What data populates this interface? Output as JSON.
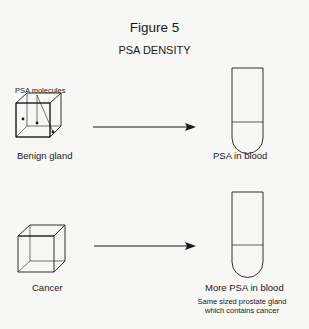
{
  "figure": {
    "title": "Figure 5",
    "subtitle": "PSA DENSITY"
  },
  "benign_row": {
    "callout_label": "PSA molecules",
    "gland_label": "Benign gland",
    "blood_label": "PSA in blood",
    "gland_dot_count": 4,
    "tube_dot_count": 3
  },
  "cancer_row": {
    "gland_label": "Cancer",
    "blood_label": "More PSA in blood",
    "note_line1": "Same sized prostate gland",
    "note_line2": "which contains cancer",
    "gland_dot_count": 10,
    "tube_dot_count": 8
  },
  "colors": {
    "background": "#f7f7f6",
    "ink": "#1a1a1a"
  }
}
